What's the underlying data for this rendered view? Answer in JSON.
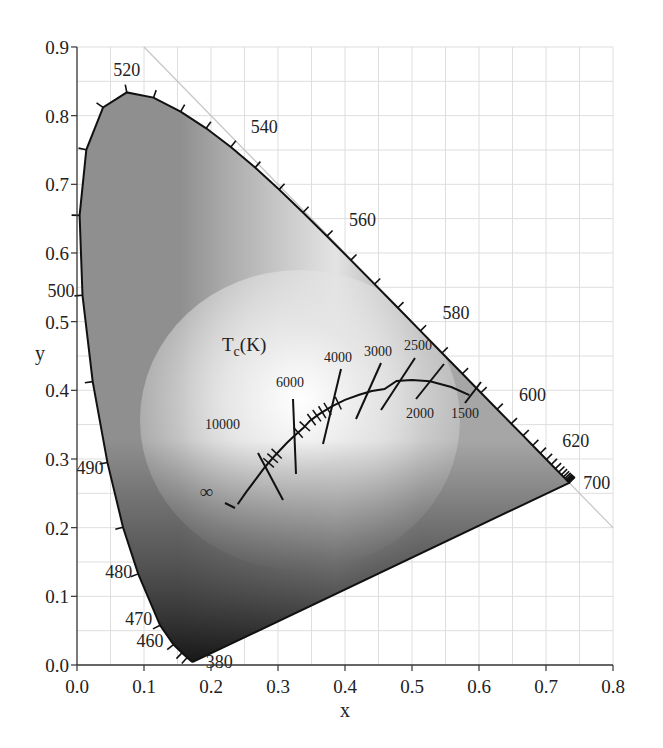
{
  "chart_data": {
    "type": "scatter",
    "xlabel": "x",
    "ylabel": "y",
    "xlim": [
      0.0,
      0.8
    ],
    "ylim": [
      0.0,
      0.9
    ],
    "grid": true,
    "grid_minor_step": 0.05,
    "x_ticks": [
      "0.0",
      "0.1",
      "0.2",
      "0.3",
      "0.4",
      "0.5",
      "0.6",
      "0.7",
      "0.8"
    ],
    "y_ticks": [
      "0.0",
      "0.1",
      "0.2",
      "0.3",
      "0.4",
      "0.5",
      "0.6",
      "0.7",
      "0.8",
      "0.9"
    ],
    "spectral_locus": {
      "x": [
        0.1741,
        0.174,
        0.1738,
        0.1736,
        0.1733,
        0.1726,
        0.1714,
        0.1689,
        0.1644,
        0.1566,
        0.144,
        0.1241,
        0.0913,
        0.0687,
        0.0454,
        0.0235,
        0.0082,
        0.0039,
        0.0139,
        0.0389,
        0.0743,
        0.1142,
        0.1547,
        0.1929,
        0.2296,
        0.2658,
        0.3016,
        0.3373,
        0.3731,
        0.4087,
        0.4441,
        0.4788,
        0.5125,
        0.5448,
        0.5752,
        0.6029,
        0.627,
        0.6482,
        0.6658,
        0.6801,
        0.6915,
        0.7006,
        0.7079,
        0.714,
        0.719,
        0.723,
        0.726,
        0.7283,
        0.73,
        0.7311,
        0.732,
        0.7327,
        0.7334,
        0.734,
        0.7344,
        0.7346,
        0.7347
      ],
      "y": [
        0.005,
        0.005,
        0.0049,
        0.0049,
        0.0048,
        0.0048,
        0.0051,
        0.0069,
        0.0109,
        0.0177,
        0.0297,
        0.0578,
        0.1327,
        0.2007,
        0.295,
        0.4127,
        0.5384,
        0.6548,
        0.7502,
        0.812,
        0.8338,
        0.8262,
        0.8059,
        0.7816,
        0.7543,
        0.7243,
        0.6923,
        0.6589,
        0.6245,
        0.5896,
        0.5547,
        0.5202,
        0.4866,
        0.4544,
        0.4242,
        0.3965,
        0.3725,
        0.3514,
        0.334,
        0.3197,
        0.3083,
        0.2993,
        0.292,
        0.2859,
        0.2809,
        0.277,
        0.274,
        0.2717,
        0.27,
        0.2689,
        0.268,
        0.2673,
        0.2666,
        0.266,
        0.2656,
        0.2654,
        0.2653
      ]
    },
    "wavelength_labels": [
      {
        "nm": "380",
        "x": 0.1741,
        "y": 0.005
      },
      {
        "nm": "460",
        "x": 0.144,
        "y": 0.0297
      },
      {
        "nm": "470",
        "x": 0.1241,
        "y": 0.0578
      },
      {
        "nm": "480",
        "x": 0.0913,
        "y": 0.1327
      },
      {
        "nm": "490",
        "x": 0.0454,
        "y": 0.295
      },
      {
        "nm": "500",
        "x": 0.0082,
        "y": 0.5384
      },
      {
        "nm": "520",
        "x": 0.0743,
        "y": 0.8338
      },
      {
        "nm": "540",
        "x": 0.2296,
        "y": 0.7543
      },
      {
        "nm": "560",
        "x": 0.3731,
        "y": 0.6245
      },
      {
        "nm": "580",
        "x": 0.5125,
        "y": 0.4866
      },
      {
        "nm": "600",
        "x": 0.627,
        "y": 0.3725
      },
      {
        "nm": "620",
        "x": 0.6915,
        "y": 0.3083
      },
      {
        "nm": "700",
        "x": 0.7347,
        "y": 0.2653
      }
    ],
    "planckian_locus": {
      "label": "Tc(K)",
      "x": [
        0.2399,
        0.253,
        0.269,
        0.2806,
        0.2952,
        0.3135,
        0.3221,
        0.3376,
        0.3474,
        0.3608,
        0.3805,
        0.4,
        0.4212,
        0.44,
        0.4589,
        0.477,
        0.5,
        0.5267,
        0.5586,
        0.5857
      ],
      "y": [
        0.2342,
        0.2525,
        0.2732,
        0.2883,
        0.3048,
        0.3237,
        0.3318,
        0.345,
        0.3555,
        0.365,
        0.3768,
        0.386,
        0.3935,
        0.399,
        0.4018,
        0.4137,
        0.415,
        0.4133,
        0.4049,
        0.3931
      ]
    },
    "isotherms": [
      {
        "label": "∞",
        "T": "infinity",
        "x": 0.2399,
        "y": 0.2342
      },
      {
        "label": "10000",
        "T": 10000,
        "x": 0.2806,
        "y": 0.2883
      },
      {
        "label": "6000",
        "T": 6000,
        "x": 0.3221,
        "y": 0.3318
      },
      {
        "label": "4000",
        "T": 4000,
        "x": 0.3805,
        "y": 0.3768
      },
      {
        "label": "3000",
        "T": 3000,
        "x": 0.437,
        "y": 0.404
      },
      {
        "label": "2500",
        "T": 2500,
        "x": 0.477,
        "y": 0.4137
      },
      {
        "label": "2000",
        "T": 2000,
        "x": 0.5267,
        "y": 0.4133
      },
      {
        "label": "1500",
        "T": 1500,
        "x": 0.5857,
        "y": 0.3931
      }
    ],
    "reference_line": {
      "desc": "x + y = 1",
      "from": [
        0.1,
        0.9
      ],
      "to": [
        0.8,
        0.2
      ]
    }
  },
  "labels": {
    "x_axis": "x",
    "y_axis": "y",
    "tc_main": "T",
    "tc_sub": "c",
    "tc_unit": "(K)"
  }
}
